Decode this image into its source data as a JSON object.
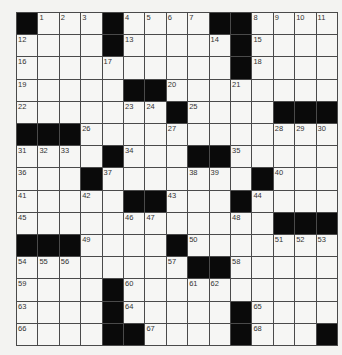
{
  "puzzle": {
    "rows": 15,
    "cols": 15,
    "colors": {
      "black": "#0a0a0a",
      "white": "#f6f6f4",
      "line": "#4a4a4a"
    },
    "grid": [
      [
        "#",
        "1",
        "2",
        "3",
        "#",
        "4",
        "5",
        "6",
        "7",
        "#",
        "#",
        "8",
        "9",
        "10",
        "11"
      ],
      [
        "12",
        "",
        "",
        "",
        "#",
        "13",
        "",
        "",
        "",
        "14",
        "#",
        "15",
        "",
        "",
        ""
      ],
      [
        "16",
        "",
        "",
        "",
        "17",
        "",
        "",
        "",
        "",
        "",
        "#",
        "18",
        "",
        "",
        ""
      ],
      [
        "19",
        "",
        "",
        "",
        "",
        "#",
        "#",
        "20",
        "",
        "",
        "21",
        "",
        "",
        "",
        ""
      ],
      [
        "22",
        "",
        "",
        "",
        "",
        "23",
        "24",
        "#",
        "25",
        "",
        "",
        "",
        "#",
        "#",
        "#"
      ],
      [
        "#",
        "#",
        "#",
        "26",
        "",
        "",
        "",
        "27",
        "",
        "",
        "",
        "",
        "28",
        "29",
        "30"
      ],
      [
        "31",
        "32",
        "33",
        "",
        "#",
        "34",
        "",
        "",
        "#",
        "#",
        "35",
        "",
        "",
        "",
        ""
      ],
      [
        "36",
        "",
        "",
        "#",
        "37",
        "",
        "",
        "",
        "38",
        "39",
        "",
        "#",
        "40",
        "",
        ""
      ],
      [
        "41",
        "",
        "",
        "42",
        "",
        "#",
        "#",
        "43",
        "",
        "",
        "#",
        "44",
        "",
        "",
        ""
      ],
      [
        "45",
        "",
        "",
        "",
        "",
        "46",
        "47",
        "",
        "",
        "",
        "48",
        "",
        "#",
        "#",
        "#"
      ],
      [
        "#",
        "#",
        "#",
        "49",
        "",
        "",
        "",
        "#",
        "50",
        "",
        "",
        "",
        "51",
        "52",
        "53"
      ],
      [
        "54",
        "55",
        "56",
        "",
        "",
        "",
        "",
        "57",
        "#",
        "#",
        "58",
        "",
        "",
        "",
        ""
      ],
      [
        "59",
        "",
        "",
        "",
        "#",
        "60",
        "",
        "",
        "61",
        "62",
        "",
        "",
        "",
        "",
        ""
      ],
      [
        "63",
        "",
        "",
        "",
        "#",
        "64",
        "",
        "",
        "",
        "",
        "#",
        "65",
        "",
        "",
        ""
      ],
      [
        "66",
        "",
        "",
        "",
        "#",
        "#",
        "67",
        "",
        "",
        "",
        "#",
        "68",
        "",
        "",
        "#"
      ]
    ]
  }
}
